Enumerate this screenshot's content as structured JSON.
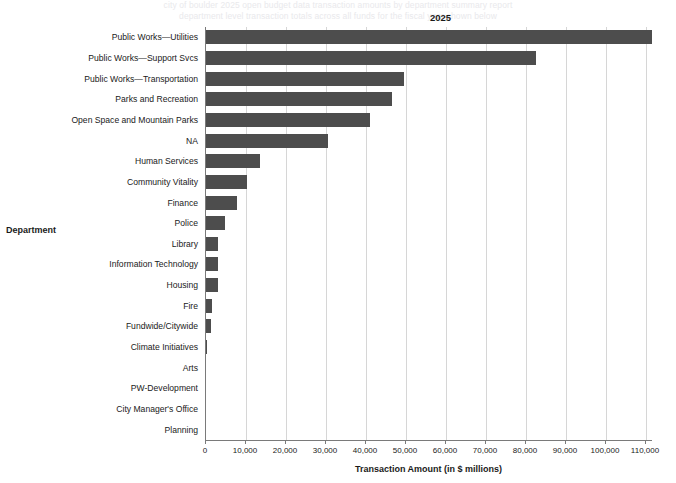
{
  "ghost": {
    "line1": "city of boulder 2025 open budget data transaction amounts by department summary report",
    "line2": "department level transaction totals across all funds for the fiscal year shown below"
  },
  "chart_data": {
    "type": "bar",
    "orientation": "horizontal",
    "title": "",
    "column_header": "2025",
    "xlabel": "Transaction Amount (in $ millions)",
    "ylabel": "Department",
    "xlim": [
      0,
      115000
    ],
    "xticks": [
      "0",
      "10,000",
      "20,000",
      "30,000",
      "40,000",
      "50,000",
      "60,000",
      "70,000",
      "80,000",
      "90,000",
      "100,000",
      "110,000"
    ],
    "xtick_values": [
      0,
      10000,
      20000,
      30000,
      40000,
      50000,
      60000,
      70000,
      80000,
      90000,
      100000,
      110000
    ],
    "grid": true,
    "legend": "none",
    "bar_color": "#4d4d4d",
    "categories": [
      "Public Works—Utilities",
      "Public Works—Support Svcs",
      "Public Works—Transportation",
      "Parks and Recreation",
      "Open Space and Mountain Parks",
      "NA",
      "Human Services",
      "Community Vitality",
      "Finance",
      "Police",
      "Library",
      "Information Technology",
      "Housing",
      "Fire",
      "Fundwide/Citywide",
      "Climate Initiatives",
      "Arts",
      "PW-Development",
      "City Manager's Office",
      "Planning"
    ],
    "values": [
      111500,
      82500,
      49500,
      46500,
      41000,
      30500,
      13500,
      10250,
      7750,
      4750,
      3000,
      2900,
      2900,
      1500,
      1300,
      300,
      0,
      0,
      0,
      0
    ]
  }
}
